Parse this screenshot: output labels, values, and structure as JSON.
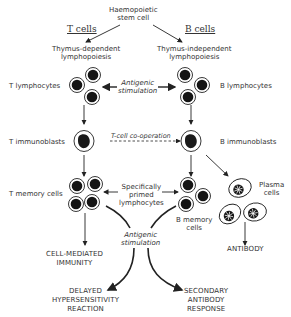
{
  "diagram": {
    "root": {
      "line1": "Haemopoietic",
      "line2": "stem cell"
    },
    "headers": {
      "t_cells": "T cells",
      "b_cells": "B cells"
    },
    "t_lineage": {
      "origin": {
        "line1": "Thymus-dependent",
        "line2": "lymphopoiesis"
      },
      "lymphocytes": "T lymphocytes",
      "immunoblasts": "T immunoblasts",
      "memory": "T memory cells"
    },
    "b_lineage": {
      "origin": {
        "line1": "Thymus-independent",
        "line2": "lymphopoiesis"
      },
      "lymphocytes": "B lymphocytes",
      "immunoblasts": "B immunoblasts",
      "memory": {
        "line1": "B memory",
        "line2": "cells"
      },
      "plasma": {
        "line1": "Plasma",
        "line2": "cells"
      }
    },
    "connectors": {
      "antigenic_top": {
        "line1": "Antigenic",
        "line2": "stimulation"
      },
      "cooperation": "T-cell co-operation",
      "primed": {
        "line1": "Specifically",
        "line2": "primed",
        "line3": "lymphocytes"
      },
      "antigenic_bottom": {
        "line1": "Antigenic",
        "line2": "stimulation"
      }
    },
    "outcomes": {
      "cmi": {
        "line1": "CELL-MEDIATED",
        "line2": "IMMUNITY"
      },
      "antibody": "ANTIBODY",
      "dth": {
        "line1": "DELAYED",
        "line2": "HYPERSENSITIVITY",
        "line3": "REACTION"
      },
      "secondary": {
        "line1": "SECONDARY",
        "line2": "ANTIBODY",
        "line3": "RESPONSE"
      }
    }
  }
}
